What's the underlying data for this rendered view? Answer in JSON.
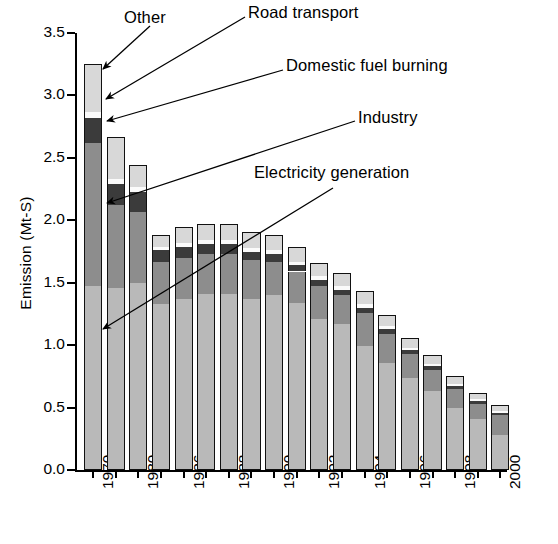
{
  "chart_data": {
    "type": "bar",
    "stacked": true,
    "title": "",
    "xlabel": "",
    "ylabel": "Emission (Mt-S)",
    "ylim": [
      0.0,
      3.5
    ],
    "ytick_labels": [
      "0.0",
      "0.5",
      "1.0",
      "1.5",
      "2.0",
      "2.5",
      "3.0",
      "3.5"
    ],
    "ytick_values": [
      0.0,
      0.5,
      1.0,
      1.5,
      2.0,
      2.5,
      3.0,
      3.5
    ],
    "grid": false,
    "legend_position": "annotations-with-leader-lines",
    "categories": [
      "1970",
      "1975",
      "1980",
      "1985",
      "1986",
      "1987",
      "1988",
      "1989",
      "1990",
      "1991",
      "1992",
      "1993",
      "1994",
      "1995",
      "1996",
      "1997",
      "1998",
      "1999",
      "2000"
    ],
    "xtick_labels_shown": [
      "1970",
      "",
      "1980",
      "",
      "1986",
      "",
      "1988",
      "",
      "1990",
      "",
      "1992",
      "",
      "1994",
      "",
      "1996",
      "",
      "1998",
      "",
      "2000"
    ],
    "series": [
      {
        "name": "Electricity generation",
        "color": "#b9b9b9",
        "values": [
          1.47,
          1.46,
          1.5,
          1.33,
          1.37,
          1.41,
          1.41,
          1.37,
          1.4,
          1.34,
          1.21,
          1.17,
          0.99,
          0.86,
          0.74,
          0.63,
          0.5,
          0.41,
          0.28
        ]
      },
      {
        "name": "Industry",
        "color": "#8d8d8d",
        "values": [
          1.15,
          0.66,
          0.57,
          0.34,
          0.33,
          0.32,
          0.32,
          0.31,
          0.27,
          0.25,
          0.26,
          0.23,
          0.27,
          0.23,
          0.19,
          0.17,
          0.15,
          0.12,
          0.16
        ]
      },
      {
        "name": "Domestic fuel burning",
        "color": "#3b3b3b",
        "values": [
          0.2,
          0.17,
          0.16,
          0.09,
          0.09,
          0.08,
          0.08,
          0.07,
          0.06,
          0.05,
          0.05,
          0.04,
          0.04,
          0.04,
          0.03,
          0.03,
          0.02,
          0.02,
          0.02
        ]
      },
      {
        "name": "Road transport",
        "color": "#fbfbfb",
        "values": [
          0.05,
          0.04,
          0.04,
          0.03,
          0.03,
          0.03,
          0.03,
          0.03,
          0.03,
          0.03,
          0.03,
          0.03,
          0.03,
          0.02,
          0.02,
          0.02,
          0.02,
          0.02,
          0.01
        ]
      },
      {
        "name": "Other",
        "color": "#d8d8d8",
        "values": [
          0.38,
          0.34,
          0.17,
          0.09,
          0.13,
          0.13,
          0.13,
          0.13,
          0.12,
          0.12,
          0.11,
          0.11,
          0.1,
          0.09,
          0.08,
          0.07,
          0.06,
          0.05,
          0.05
        ]
      }
    ],
    "totals": [
      3.25,
      2.67,
      2.44,
      1.88,
      1.95,
      1.97,
      1.97,
      1.91,
      1.88,
      1.79,
      1.66,
      1.58,
      1.43,
      1.24,
      1.06,
      0.92,
      0.75,
      0.62,
      0.52
    ]
  },
  "annotations": [
    {
      "id": "other",
      "label": "Other"
    },
    {
      "id": "road",
      "label": "Road transport"
    },
    {
      "id": "domestic",
      "label": "Domestic fuel burning"
    },
    {
      "id": "industry",
      "label": "Industry"
    },
    {
      "id": "electricity",
      "label": "Electricity generation"
    }
  ]
}
